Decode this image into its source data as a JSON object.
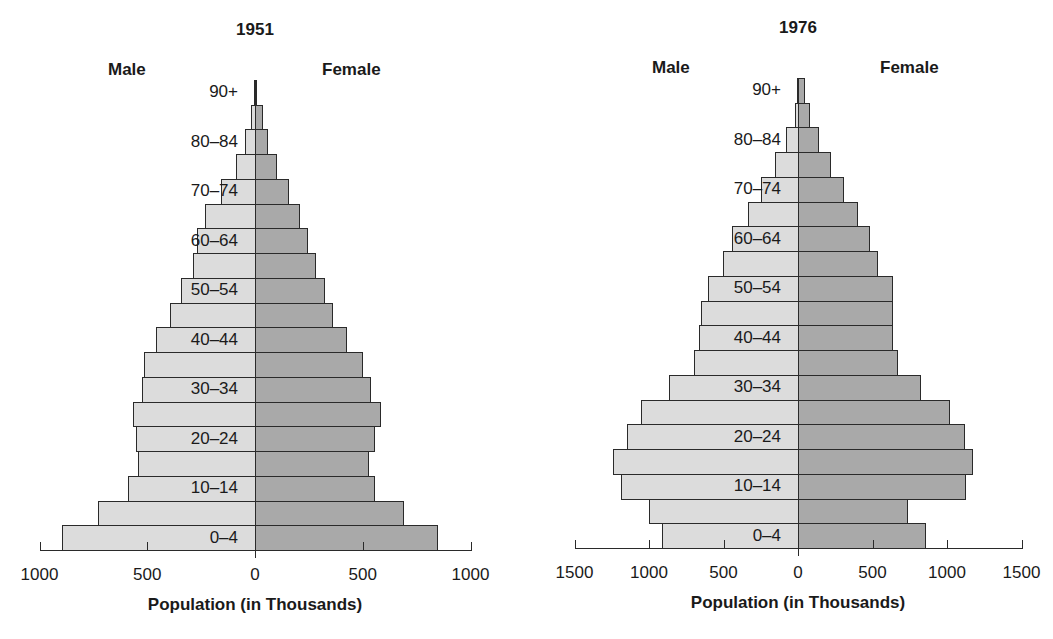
{
  "chart_data": [
    {
      "type": "bar",
      "subtype": "population-pyramid",
      "title": "1951",
      "xlabel": "Population (in Thousands)",
      "ylabel": "",
      "left_label": "Male",
      "right_label": "Female",
      "xlim": [
        -1000,
        1000
      ],
      "xticks": [
        "1000",
        "500",
        "0",
        "500",
        "1000"
      ],
      "age_labels_shown": [
        "90+",
        "80–84",
        "70–74",
        "60–64",
        "50–54",
        "40–44",
        "30–34",
        "20–24",
        "10–14",
        "0–4"
      ],
      "categories": [
        "0–4",
        "5–9",
        "10–14",
        "15–19",
        "20–24",
        "25–29",
        "30–34",
        "35–39",
        "40–44",
        "45–49",
        "50–54",
        "55–59",
        "60–64",
        "65–69",
        "70–74",
        "75–79",
        "80–84",
        "85–89",
        "90+"
      ],
      "series": [
        {
          "name": "Male",
          "color": "#dcdcdc",
          "values": [
            895,
            730,
            590,
            545,
            550,
            565,
            525,
            515,
            460,
            395,
            345,
            290,
            270,
            230,
            160,
            90,
            45,
            20,
            5
          ]
        },
        {
          "name": "Female",
          "color": "#a9a9a9",
          "values": [
            850,
            690,
            555,
            530,
            555,
            585,
            540,
            500,
            425,
            360,
            325,
            285,
            245,
            210,
            160,
            100,
            60,
            35,
            10
          ]
        }
      ],
      "grid": false,
      "legend": "none"
    },
    {
      "type": "bar",
      "subtype": "population-pyramid",
      "title": "1976",
      "xlabel": "Population (in Thousands)",
      "ylabel": "",
      "left_label": "Male",
      "right_label": "Female",
      "xlim": [
        -1500,
        1500
      ],
      "xticks": [
        "1500",
        "1000",
        "500",
        "0",
        "500",
        "1000",
        "1500"
      ],
      "age_labels_shown": [
        "90+",
        "80–84",
        "70–74",
        "60–64",
        "50–54",
        "40–44",
        "30–34",
        "20–24",
        "10–14",
        "0–4"
      ],
      "categories": [
        "0–4",
        "5–9",
        "10–14",
        "15–19",
        "20–24",
        "25–29",
        "30–34",
        "35–39",
        "40–44",
        "45–49",
        "50–54",
        "55–59",
        "60–64",
        "65–69",
        "70–74",
        "75–79",
        "80–84",
        "85–89",
        "90+"
      ],
      "series": [
        {
          "name": "Male",
          "color": "#dcdcdc",
          "values": [
            910,
            1000,
            1190,
            1240,
            1150,
            1055,
            865,
            700,
            665,
            650,
            605,
            505,
            445,
            335,
            250,
            155,
            80,
            20,
            5
          ]
        },
        {
          "name": "Female",
          "color": "#a9a9a9",
          "values": [
            860,
            740,
            1130,
            1175,
            1120,
            1020,
            825,
            670,
            640,
            640,
            640,
            540,
            485,
            400,
            310,
            220,
            140,
            80,
            45
          ]
        }
      ],
      "grid": false,
      "legend": "none"
    }
  ]
}
